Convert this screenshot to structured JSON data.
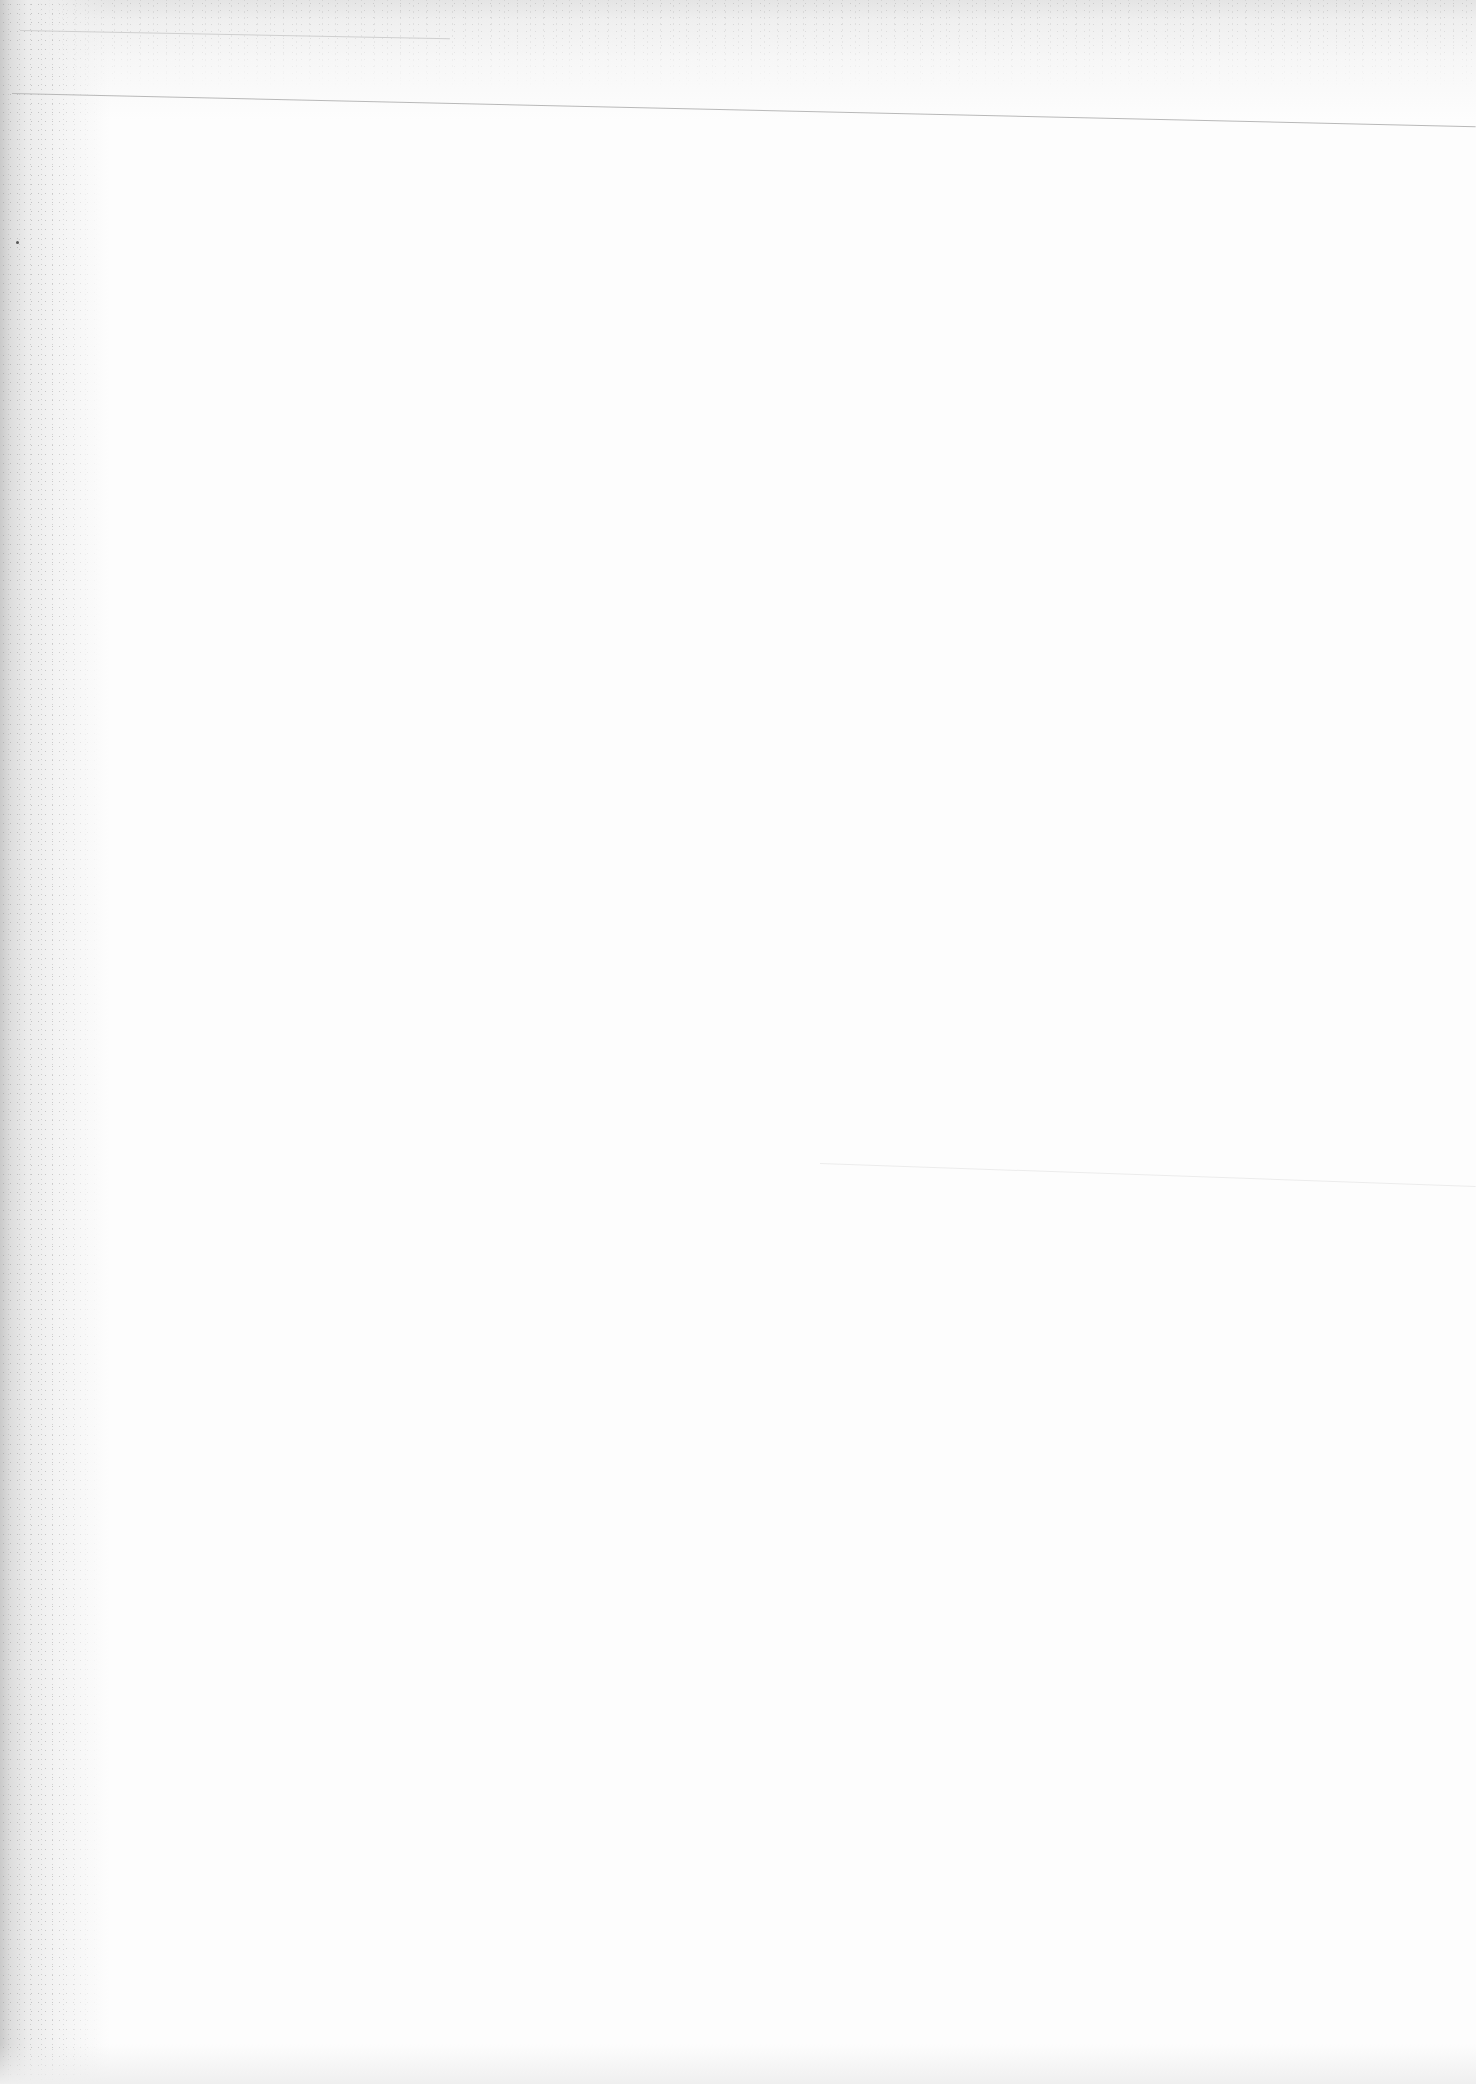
{
  "document": {
    "type": "scanned-page",
    "content": "blank",
    "visible_text": []
  }
}
